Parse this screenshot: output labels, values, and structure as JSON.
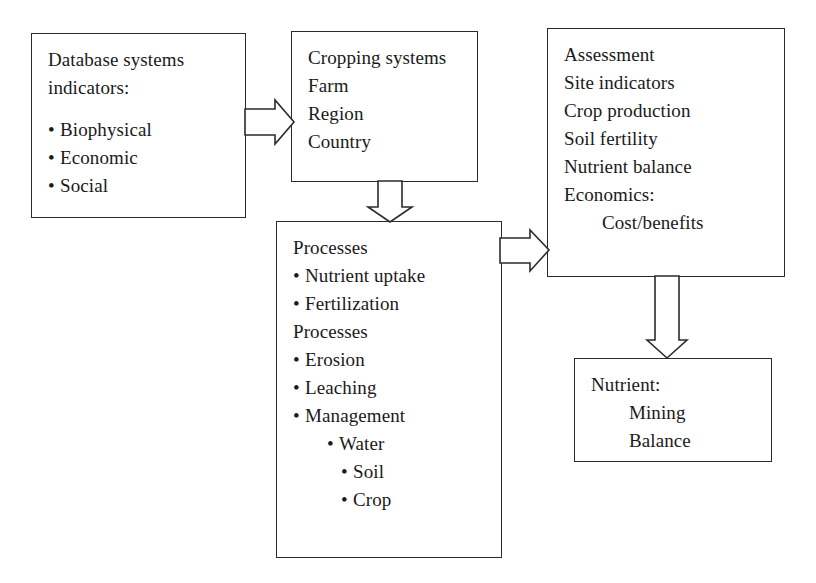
{
  "diagram": {
    "colors": {
      "stroke": "#2b2b2b",
      "background": "#ffffff",
      "text": "#1a1a1a"
    },
    "boxes": {
      "database_systems": {
        "name": "database-systems-indicators",
        "lines": [
          "Database systems",
          "indicators:",
          "Biophysical",
          "Economic",
          "Social"
        ]
      },
      "cropping_systems": {
        "name": "cropping-systems",
        "lines": [
          "Cropping systems",
          "Farm",
          "Region",
          "Country"
        ]
      },
      "assessment": {
        "name": "assessment",
        "lines": [
          "Assessment",
          "Site indicators",
          "Crop production",
          "Soil fertility",
          "Nutrient balance",
          "Economics:",
          "Cost/benefits"
        ]
      },
      "processes": {
        "name": "processes",
        "lines": [
          "Processes",
          "Nutrient uptake",
          "Fertilization",
          "Processes",
          "Erosion",
          "Leaching",
          "Management",
          "Water",
          "Soil",
          "Crop"
        ]
      },
      "nutrient": {
        "name": "nutrient",
        "lines": [
          "Nutrient:",
          "Mining",
          "Balance"
        ]
      }
    },
    "arrows": [
      {
        "name": "arrow-database-to-cropping",
        "direction": "right",
        "from": "database_systems",
        "to": "cropping_systems"
      },
      {
        "name": "arrow-cropping-to-processes",
        "direction": "down",
        "from": "cropping_systems",
        "to": "processes"
      },
      {
        "name": "arrow-processes-to-assessment",
        "direction": "right",
        "from": "processes",
        "to": "assessment"
      },
      {
        "name": "arrow-assessment-to-nutrient",
        "direction": "down",
        "from": "assessment",
        "to": "nutrient"
      }
    ]
  }
}
